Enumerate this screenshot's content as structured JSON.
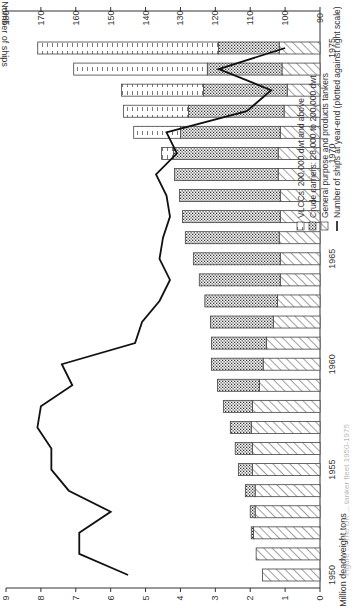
{
  "chart_data": {
    "type": "bar",
    "subtype": "stacked-bar-with-line",
    "orientation_note": "figure displayed rotated 90 degrees counter-clockwise",
    "title": "",
    "caption": "Figure ... The UK ... tanker fleet 1950-1975",
    "xlabel": "",
    "ylabel": "Million deadweight tons",
    "y2label": "Number of ships",
    "ylim": [
      0,
      9
    ],
    "y2lim": [
      90,
      180
    ],
    "yticks": [
      0,
      1,
      2,
      3,
      4,
      5,
      6,
      7,
      8,
      9
    ],
    "y2ticks": [
      90,
      100,
      110,
      120,
      130,
      140,
      150,
      160,
      170,
      180
    ],
    "xtick_labels": [
      "1950",
      "1955",
      "1960",
      "1965",
      "1970",
      "1975"
    ],
    "grid": false,
    "categories": [
      "1950",
      "1951",
      "1952",
      "1953",
      "1954",
      "1955",
      "1956",
      "1957",
      "1958",
      "1959",
      "1960",
      "1961",
      "1962",
      "1963",
      "1964",
      "1965",
      "1966",
      "1967",
      "1968",
      "1969",
      "1970",
      "1971",
      "1972",
      "1973",
      "1974",
      "1975"
    ],
    "series": [
      {
        "name": "General purpose and products tankers",
        "pattern": "diagonal-hatch",
        "axis": "left",
        "values": [
          1.65,
          1.83,
          1.91,
          1.86,
          1.86,
          1.94,
          1.94,
          1.97,
          1.94,
          1.74,
          1.63,
          1.54,
          1.34,
          1.22,
          1.14,
          1.14,
          1.17,
          1.14,
          1.14,
          1.2,
          1.2,
          1.14,
          1.03,
          0.94,
          1.09,
          1.17
        ]
      },
      {
        "name": "Crude carriers: 28,000 to 200,000 dwt",
        "pattern": "dotted",
        "axis": "left",
        "values": [
          0,
          0,
          0.06,
          0.14,
          0.28,
          0.4,
          0.49,
          0.6,
          0.83,
          1.2,
          1.48,
          1.57,
          1.8,
          2.08,
          2.32,
          2.49,
          2.69,
          2.8,
          2.89,
          2.97,
          3.0,
          2.86,
          2.74,
          2.4,
          2.14,
          1.74
        ]
      },
      {
        "name": "VLCCs: 200,000 dwt and above",
        "pattern": "dashed",
        "axis": "left",
        "values": [
          0,
          0,
          0,
          0,
          0,
          0,
          0,
          0,
          0,
          0,
          0,
          0,
          0,
          0,
          0,
          0,
          0,
          0,
          0,
          0,
          0.34,
          1.34,
          1.86,
          2.35,
          3.83,
          5.18
        ]
      },
      {
        "name": "Number of ships at year-end (plotted against right scale)",
        "type": "line",
        "axis": "right",
        "values": [
          145,
          159,
          159,
          150,
          162,
          167,
          167,
          171,
          170,
          161,
          164,
          143,
          141,
          136,
          133,
          136,
          135,
          133,
          134,
          137,
          131,
          134,
          111,
          104,
          119,
          100
        ]
      }
    ],
    "legend": {
      "position": "upper-left (inside plot)",
      "entries": [
        "VLCCs: 200,000 dwt and above",
        "Crude carriers: 28,000 to 200,000 dwt",
        "General purpose and products tankers",
        "Number of ships at year-end (plotted against right scale)"
      ]
    }
  }
}
